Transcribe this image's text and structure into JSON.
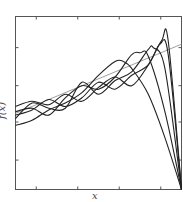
{
  "chart_data": {
    "type": "line",
    "title": "",
    "xlabel": "x",
    "ylabel": "f(x)",
    "xlim": [
      0,
      1
    ],
    "ylim": [
      0,
      1
    ],
    "grid": false,
    "legend": null,
    "x_ticks": [
      0.125,
      0.375,
      0.625,
      0.875
    ],
    "y_ticks": [
      0.17,
      0.39,
      0.6,
      0.82
    ],
    "tick_labels_shown": false,
    "series": [
      {
        "name": "trend",
        "color": "#a0a0a0",
        "style": "solid-gray",
        "x": [
          0,
          1
        ],
        "y": [
          0.44,
          0.84
        ]
      },
      {
        "name": "curve-1",
        "color": "#222222",
        "x": [
          0,
          0.1,
          0.2,
          0.3,
          0.4,
          0.5,
          0.6,
          0.65,
          0.7,
          0.8,
          0.9,
          1.0
        ],
        "y": [
          0.37,
          0.4,
          0.46,
          0.5,
          0.56,
          0.66,
          0.74,
          0.74,
          0.7,
          0.55,
          0.3,
          0.0
        ]
      },
      {
        "name": "curve-2",
        "color": "#222222",
        "x": [
          0,
          0.1,
          0.2,
          0.3,
          0.4,
          0.5,
          0.6,
          0.7,
          0.75,
          0.8,
          0.9,
          1.0
        ],
        "y": [
          0.45,
          0.47,
          0.43,
          0.53,
          0.6,
          0.58,
          0.65,
          0.78,
          0.79,
          0.77,
          0.45,
          0.0
        ]
      },
      {
        "name": "curve-3",
        "color": "#222222",
        "x": [
          0,
          0.1,
          0.2,
          0.3,
          0.4,
          0.5,
          0.6,
          0.7,
          0.8,
          0.83,
          0.9,
          1.0
        ],
        "y": [
          0.41,
          0.5,
          0.47,
          0.47,
          0.62,
          0.55,
          0.63,
          0.68,
          0.81,
          0.82,
          0.7,
          0.0
        ]
      },
      {
        "name": "curve-4",
        "color": "#222222",
        "x": [
          0,
          0.1,
          0.2,
          0.3,
          0.4,
          0.5,
          0.6,
          0.7,
          0.8,
          0.87,
          0.92,
          1.0
        ],
        "y": [
          0.43,
          0.46,
          0.52,
          0.48,
          0.53,
          0.62,
          0.58,
          0.66,
          0.72,
          0.84,
          0.78,
          0.0
        ]
      },
      {
        "name": "curve-5",
        "color": "#222222",
        "x": [
          0,
          0.1,
          0.2,
          0.3,
          0.4,
          0.5,
          0.6,
          0.7,
          0.8,
          0.88,
          0.92,
          1.0
        ],
        "y": [
          0.48,
          0.51,
          0.49,
          0.55,
          0.51,
          0.59,
          0.65,
          0.6,
          0.72,
          0.86,
          0.86,
          0.0
        ]
      }
    ]
  },
  "labels": {
    "x": "x",
    "y": "f(x)"
  }
}
